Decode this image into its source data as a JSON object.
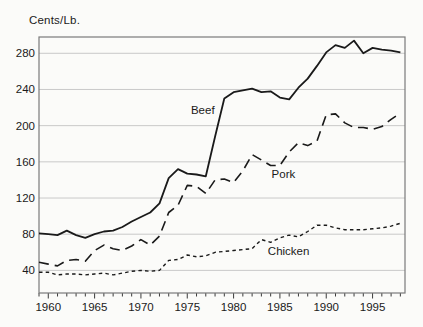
{
  "chart_data": {
    "type": "line",
    "title": "",
    "ylabel": "Cents/Lb.",
    "xlabel": "",
    "grid": "horizontal",
    "legend": "inline-labels",
    "xlim": [
      1959,
      1998.5
    ],
    "ylim": [
      15,
      298
    ],
    "y_ticks": [
      40,
      80,
      120,
      160,
      200,
      240,
      280
    ],
    "x_tick_labels": [
      1960,
      1965,
      1970,
      1975,
      1980,
      1985,
      1990,
      1995
    ],
    "x_minor_tick_step_years": 1,
    "colors": {
      "line": "#1a1a1a",
      "border": "#7a7a7a",
      "grid": "#c9c9c9",
      "text": "#1a1a1a"
    },
    "x": [
      1959,
      1960,
      1961,
      1962,
      1963,
      1964,
      1965,
      1966,
      1967,
      1968,
      1969,
      1970,
      1971,
      1972,
      1973,
      1974,
      1975,
      1976,
      1977,
      1978,
      1979,
      1980,
      1981,
      1982,
      1983,
      1984,
      1985,
      1986,
      1987,
      1988,
      1989,
      1990,
      1991,
      1992,
      1993,
      1994,
      1995,
      1996,
      1997,
      1998
    ],
    "series": [
      {
        "name": "Beef",
        "line_style": "solid",
        "label_at": {
          "year": 1975.4,
          "value": 217
        },
        "values": [
          81,
          80,
          79,
          84,
          79,
          76,
          80,
          83,
          84,
          88,
          94,
          99,
          104,
          114,
          142,
          152,
          147,
          146,
          144,
          188,
          230,
          237,
          239,
          241,
          237,
          238,
          231,
          229,
          242,
          252,
          266,
          281,
          289,
          286,
          294,
          280,
          286,
          284,
          283,
          281
        ]
      },
      {
        "name": "Pork",
        "line_style": "long-dash",
        "label_at": {
          "year": 1984.1,
          "value": 147
        },
        "values": [
          49,
          47,
          45,
          51,
          52,
          50,
          62,
          68,
          64,
          62,
          67,
          74,
          68,
          78,
          104,
          112,
          134,
          133,
          125,
          140,
          141,
          137,
          150,
          168,
          162,
          156,
          156,
          171,
          181,
          178,
          183,
          212,
          213,
          203,
          198,
          198,
          196,
          199,
          207,
          214
        ]
      },
      {
        "name": "Chicken",
        "line_style": "short-dash",
        "label_at": {
          "year": 1983.7,
          "value": 61
        },
        "values": [
          38,
          38,
          35,
          36,
          36,
          35,
          36,
          37,
          35,
          37,
          39,
          40,
          39,
          40,
          51,
          52,
          57,
          55,
          56,
          60,
          61,
          62,
          63,
          64,
          74,
          71,
          76,
          79,
          77,
          83,
          90,
          90,
          87,
          85,
          85,
          85,
          86,
          87,
          89,
          92
        ]
      }
    ]
  }
}
